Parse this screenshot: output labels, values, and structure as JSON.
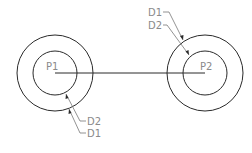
{
  "diagram": {
    "points": [
      {
        "id": "p1",
        "label": "P1",
        "cx": 55,
        "cy": 73,
        "outer_r": 38,
        "inner_r": 22
      },
      {
        "id": "p2",
        "label": "P2",
        "cx": 205,
        "cy": 73,
        "outer_r": 38,
        "inner_r": 22
      }
    ],
    "connector": {
      "from": "P1",
      "to": "P2"
    },
    "callouts": {
      "p1_d2": "D2",
      "p1_d1": "D1",
      "p2_d1": "D1",
      "p2_d2": "D2"
    },
    "colors": {
      "geometry": "#2a2a2a",
      "labels": "#8a8a8a",
      "background": "#ffffff"
    }
  }
}
